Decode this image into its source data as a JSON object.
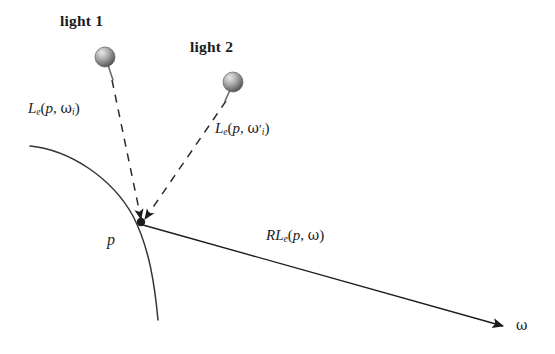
{
  "figure": {
    "type": "diagram",
    "background_color": "#ffffff",
    "stroke_color": "#1c1c1c"
  },
  "lights": [
    {
      "id": "light-1",
      "label": "light 1",
      "label_x": 60,
      "label_y": 13,
      "sphere_cx": 105,
      "sphere_cy": 57,
      "sphere_r": 10,
      "stem_x2": 112,
      "stem_y2": 79,
      "color_light": "#d9d9d9",
      "color_dark": "#555555"
    },
    {
      "id": "light-2",
      "label": "light 2",
      "label_x": 190,
      "label_y": 39,
      "sphere_cx": 233,
      "sphere_cy": 82,
      "sphere_r": 10,
      "stem_x2": 226,
      "stem_y2": 100,
      "color_light": "#d9d9d9",
      "color_dark": "#555555"
    }
  ],
  "surface": {
    "name": "curved-surface",
    "path": "M 30 146 C 70 150 112 178 133 216 C 150 249 155 288 158 320"
  },
  "point": {
    "name": "intersection-point",
    "label": "p",
    "x": 141,
    "y": 222,
    "label_x": 107,
    "label_y": 232
  },
  "incident_rays": [
    {
      "id": "ray-incident-1",
      "from_light": "light 1",
      "x1": 112,
      "y1": 80,
      "x2": 141,
      "y2": 221,
      "dashed": true,
      "label": {
        "prefix": "L",
        "sub": "e",
        "args": "(p, ω",
        "arg_sub": "i",
        "suffix": ")",
        "full": "Le(p, ωi)",
        "x": 28,
        "y": 101
      }
    },
    {
      "id": "ray-incident-2",
      "from_light": "light 2",
      "x1": 226,
      "y1": 101,
      "x2": 143,
      "y2": 221,
      "dashed": true,
      "label": {
        "prefix": "L",
        "sub": "e",
        "args": "(p, ω",
        "arg_sub": "i",
        "prime": "′",
        "suffix": ")",
        "full": "Le(p, ω′i)",
        "x": 215,
        "y": 121
      }
    }
  ],
  "reflected_ray": {
    "id": "ray-reflected",
    "x1": 143,
    "y1": 225,
    "x2": 505,
    "y2": 327,
    "dashed": false,
    "arrowhead": true,
    "label": {
      "prefix": "RL",
      "sub": "e",
      "args": "(p, ω)",
      "full": "RLe(p, ω)",
      "x": 266,
      "y": 228
    },
    "direction_label": {
      "text": "ω",
      "x": 516,
      "y": 318
    }
  },
  "labels": {
    "light1": "light 1",
    "light2": "light 2",
    "le1_base": "L",
    "le1_sub": "e",
    "le1_open": "(",
    "le1_p": "p",
    "le1_comma": ", ",
    "le1_omega": "ω",
    "le1_omega_sub": "i",
    "le1_close": ")",
    "le2_base": "L",
    "le2_sub": "e",
    "le2_open": "(",
    "le2_p": "p",
    "le2_comma": ", ",
    "le2_omega": "ω",
    "le2_prime": "′",
    "le2_omega_sub": "i",
    "le2_close": ")",
    "rle_base": "RL",
    "rle_sub": "e",
    "rle_open": "(",
    "rle_p": "p",
    "rle_comma": ", ",
    "rle_omega": "ω",
    "rle_close": ")",
    "point_p": "p",
    "omega_axis": "ω"
  }
}
